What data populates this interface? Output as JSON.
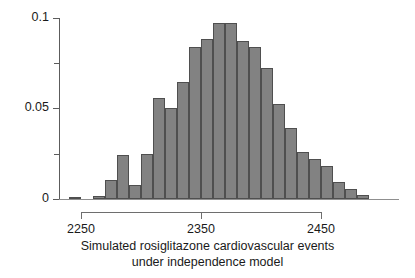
{
  "chart_data": {
    "type": "bar",
    "title": "",
    "subtitle": "",
    "xlabel_line1": "Simulated rosiglitazone cardiovascular events",
    "xlabel_line2": "under independence model",
    "ylabel": "",
    "grid": false,
    "legend": "none",
    "xlim": [
      2240,
      2492
    ],
    "ylim": [
      0,
      0.1
    ],
    "bin_width": 10,
    "xticks": [
      2250,
      2350,
      2450
    ],
    "xtick_labels": [
      "2250",
      "2350",
      "2450"
    ],
    "yticks": [
      0,
      0.05,
      0.1
    ],
    "ytick_labels": [
      "0",
      "0.05",
      "0.1"
    ],
    "yticks_minor": [
      0.025,
      0.075
    ],
    "bar_fill_color": "#828282",
    "bar_edge_color": "#4f4f4f",
    "axis_color": "#5c5c5c",
    "bin_starts": [
      2240,
      2250,
      2260,
      2270,
      2280,
      2290,
      2300,
      2310,
      2320,
      2330,
      2340,
      2350,
      2360,
      2370,
      2380,
      2390,
      2400,
      2410,
      2420,
      2430,
      2440,
      2450,
      2460,
      2470,
      2480
    ],
    "categories": [
      "2240",
      "2250",
      "2260",
      "2270",
      "2280",
      "2290",
      "2300",
      "2310",
      "2320",
      "2330",
      "2340",
      "2350",
      "2360",
      "2370",
      "2380",
      "2390",
      "2400",
      "2410",
      "2420",
      "2430",
      "2440",
      "2450",
      "2460",
      "2470",
      "2480"
    ],
    "values": [
      0.0012,
      0.0,
      0.0018,
      0.0105,
      0.0243,
      0.0077,
      0.0248,
      0.0556,
      0.0504,
      0.0645,
      0.0841,
      0.0883,
      0.0975,
      0.0975,
      0.0872,
      0.0839,
      0.0723,
      0.0527,
      0.0392,
      0.0257,
      0.0222,
      0.0182,
      0.0094,
      0.0055,
      0.0021
    ]
  },
  "axis": {
    "y_labels": [
      "0.1",
      "0.05",
      "0"
    ],
    "x_labels": [
      "2250",
      "2350",
      "2450"
    ]
  },
  "caption": {
    "line1": "Simulated rosiglitazone cardiovascular events",
    "line2": "under independence model"
  }
}
